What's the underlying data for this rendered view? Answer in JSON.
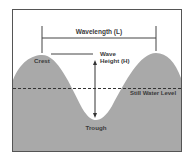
{
  "diagram": {
    "labels": {
      "wavelength": "Wavelength (L)",
      "wave_height_line1": "Wave",
      "wave_height_line2": "Height (H)",
      "crest": "Crest",
      "trough": "Trough",
      "still_water_level": "Still Water Level"
    },
    "colors": {
      "water": "#a9a9a9",
      "frame": "#555555",
      "lines": "#444444",
      "text": "#3a3a3a",
      "background": "#ffffff"
    }
  }
}
